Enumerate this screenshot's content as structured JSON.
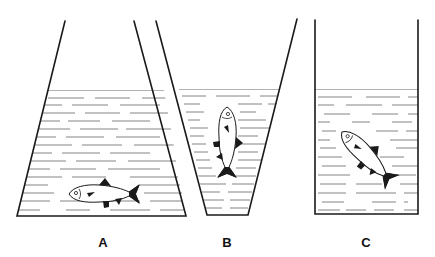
{
  "figure": {
    "containers": [
      {
        "id": "A",
        "label": "A",
        "shape": "widening-trapezoid",
        "fish_orientation": "horizontal"
      },
      {
        "id": "B",
        "label": "B",
        "shape": "narrowing-trapezoid",
        "fish_orientation": "vertical-head-up"
      },
      {
        "id": "C",
        "label": "C",
        "shape": "rectangle",
        "fish_orientation": "diagonal-head-up"
      }
    ]
  },
  "colors": {
    "line": "#1a1a1a",
    "water_dash": "#777777",
    "background": "#ffffff"
  }
}
